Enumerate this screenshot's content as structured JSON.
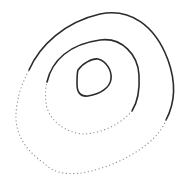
{
  "diagram": {
    "type": "contour-lines",
    "background": "#ffffff",
    "colors": {
      "solid_stroke": "#2b2b2b",
      "dotted_stroke": "#8a8a8a"
    },
    "contours": [
      {
        "name": "outer-contour",
        "solid_path": "M29,70 C40,45 65,22 100,14 C130,8 155,25 168,60 C176,82 175,103 166,120",
        "dotted_path": "M166,120 C158,142 125,162 95,170 C75,176 55,175 45,164 C25,150 12,132 17,105 C19,90 24,80 29,70"
      },
      {
        "name": "middle-contour",
        "solid_path": "M47,82 C52,60 70,44 100,40 C122,37 138,55 139,75 C140,92 137,103 132,111",
        "dotted_path": "M132,111 C120,125 100,134 82,134 C65,132 52,122 47,108 C45,99 45,90 47,82"
      },
      {
        "name": "inner-contour",
        "solid_path": "M78,70 C82,64 92,58 98,59 C106,61 112,70 111,79 C110,88 100,94 88,96 C80,97 77,92 77,84 C77,78 77,73 78,70 Z",
        "dotted_path": ""
      }
    ]
  }
}
